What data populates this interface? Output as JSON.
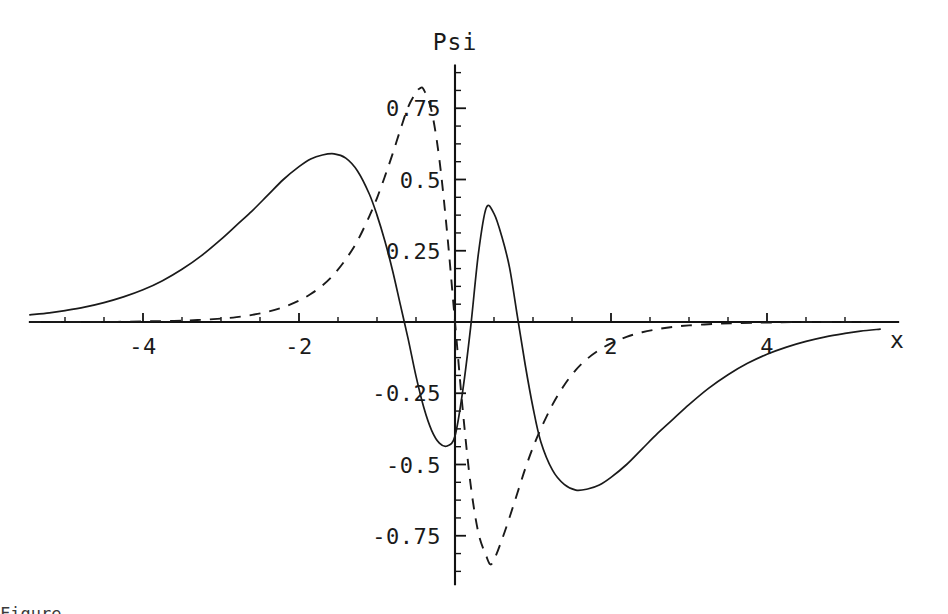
{
  "figure": {
    "background_color": "#ffffff",
    "ink_color": "#1a1a1a",
    "title": "Psi",
    "x_axis_name": "x",
    "cut_off_caption": "Figure"
  },
  "chart_data": {
    "type": "line",
    "title": "Psi",
    "xlabel": "x",
    "ylabel": "Psi",
    "xlim": [
      -5.45,
      5.45
    ],
    "ylim": [
      -0.92,
      0.9
    ],
    "grid": false,
    "legend": "none",
    "x_ticks_major": [
      -4,
      -2,
      2,
      4
    ],
    "x_tick_labels": [
      "-4",
      "-2",
      "2",
      "4"
    ],
    "x_ticks_minor": [
      -5,
      -4.5,
      -3.5,
      -3,
      -2.5,
      -1.5,
      -1,
      -0.5,
      0.5,
      1,
      1.5,
      2.5,
      3,
      3.5,
      4.5,
      5
    ],
    "y_ticks_major": [
      0.75,
      0.5,
      0.25,
      -0.25,
      -0.5,
      -0.75
    ],
    "y_tick_labels": [
      "0.75",
      "0.5",
      "0.25",
      "-0.25",
      "-0.5",
      "-0.75"
    ],
    "y_ticks_minor": [
      0.875,
      0.8125,
      0.6875,
      0.625,
      0.5625,
      0.4375,
      0.375,
      0.3125,
      0.1875,
      0.125,
      0.0625,
      -0.0625,
      -0.125,
      -0.1875,
      -0.3125,
      -0.375,
      -0.4375,
      -0.5625,
      -0.625,
      -0.6875,
      -0.8125,
      -0.875
    ],
    "series": [
      {
        "name": "solid-curve",
        "style": "solid",
        "color": "#1a1a1a",
        "x": [
          -5.45,
          -5.2,
          -5.0,
          -4.75,
          -4.5,
          -4.25,
          -4.0,
          -3.75,
          -3.5,
          -3.25,
          -3.0,
          -2.8,
          -2.6,
          -2.4,
          -2.2,
          -2.0,
          -1.85,
          -1.7,
          -1.55,
          -1.4,
          -1.25,
          -1.1,
          -1.0,
          -0.9,
          -0.8,
          -0.7,
          -0.6,
          -0.5,
          -0.4,
          -0.3,
          -0.2,
          -0.1,
          0.0,
          0.1,
          0.2,
          0.3,
          0.4,
          0.5,
          0.6,
          0.7,
          0.8,
          0.9,
          1.0,
          1.1,
          1.25,
          1.4,
          1.55,
          1.7,
          1.85,
          2.0,
          2.2,
          2.4,
          2.6,
          2.8,
          3.0,
          3.25,
          3.5,
          3.75,
          4.0,
          4.25,
          4.5,
          4.75,
          5.0,
          5.2,
          5.45
        ],
        "y": [
          0.025,
          0.032,
          0.04,
          0.052,
          0.068,
          0.088,
          0.113,
          0.145,
          0.185,
          0.233,
          0.29,
          0.34,
          0.39,
          0.445,
          0.5,
          0.545,
          0.572,
          0.586,
          0.59,
          0.575,
          0.53,
          0.45,
          0.375,
          0.285,
          0.18,
          0.06,
          -0.06,
          -0.19,
          -0.3,
          -0.38,
          -0.425,
          -0.435,
          -0.4,
          -0.24,
          -0.02,
          0.24,
          0.4,
          0.38,
          0.3,
          0.19,
          0.02,
          -0.15,
          -0.3,
          -0.42,
          -0.52,
          -0.57,
          -0.59,
          -0.586,
          -0.572,
          -0.545,
          -0.5,
          -0.445,
          -0.39,
          -0.34,
          -0.29,
          -0.233,
          -0.185,
          -0.145,
          -0.113,
          -0.088,
          -0.068,
          -0.052,
          -0.04,
          -0.032,
          -0.025
        ]
      },
      {
        "name": "dashed-curve",
        "style": "dashed",
        "color": "#1a1a1a",
        "x": [
          -5.45,
          -5.0,
          -4.5,
          -4.0,
          -3.6,
          -3.3,
          -3.0,
          -2.8,
          -2.6,
          -2.4,
          -2.2,
          -2.0,
          -1.85,
          -1.7,
          -1.55,
          -1.4,
          -1.25,
          -1.1,
          -1.0,
          -0.9,
          -0.8,
          -0.7,
          -0.6,
          -0.5,
          -0.45,
          -0.4,
          -0.3,
          -0.2,
          -0.1,
          0.0,
          0.1,
          0.2,
          0.3,
          0.4,
          0.45,
          0.5,
          0.6,
          0.7,
          0.8,
          0.9,
          1.0,
          1.1,
          1.25,
          1.4,
          1.55,
          1.7,
          1.85,
          2.0,
          2.2,
          2.4,
          2.6,
          2.8,
          3.0,
          3.3,
          3.6,
          4.0,
          4.5,
          5.0,
          5.45
        ],
        "y": [
          0.0,
          0.0,
          0.0,
          0.002,
          0.004,
          0.007,
          0.012,
          0.017,
          0.025,
          0.036,
          0.052,
          0.075,
          0.098,
          0.128,
          0.168,
          0.22,
          0.285,
          0.37,
          0.435,
          0.51,
          0.59,
          0.675,
          0.755,
          0.805,
          0.82,
          0.815,
          0.74,
          0.57,
          0.31,
          0.0,
          -0.31,
          -0.57,
          -0.74,
          -0.82,
          -0.85,
          -0.835,
          -0.765,
          -0.685,
          -0.6,
          -0.515,
          -0.44,
          -0.375,
          -0.29,
          -0.222,
          -0.168,
          -0.128,
          -0.098,
          -0.075,
          -0.052,
          -0.036,
          -0.025,
          -0.017,
          -0.012,
          -0.007,
          -0.004,
          -0.002,
          0.0,
          0.0,
          0.0
        ]
      }
    ]
  }
}
